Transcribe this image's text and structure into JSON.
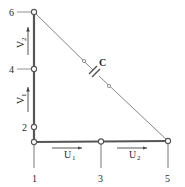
{
  "diagram": {
    "type": "truss-element",
    "nodes": [
      {
        "id": "1",
        "label": "1",
        "x": 34,
        "y": 142
      },
      {
        "id": "2",
        "label": "2",
        "x": 34,
        "y": 127
      },
      {
        "id": "3",
        "label": "3",
        "x": 101,
        "y": 142
      },
      {
        "id": "4",
        "label": "4",
        "x": 34,
        "y": 69
      },
      {
        "id": "5",
        "label": "5",
        "x": 168,
        "y": 142
      },
      {
        "id": "6",
        "label": "6",
        "x": 34,
        "y": 12
      }
    ],
    "displacement_labels": {
      "v1": {
        "main": "V",
        "sub": "1"
      },
      "v2": {
        "main": "V",
        "sub": "2"
      },
      "u1": {
        "main": "U",
        "sub": "1"
      },
      "u2": {
        "main": "U",
        "sub": "2"
      }
    },
    "capacitor_label": "C",
    "colors": {
      "line": "#6a6a6a",
      "thick_line": "#555555",
      "node_fill": "#ffffff",
      "text": "#2a2a2a"
    }
  }
}
